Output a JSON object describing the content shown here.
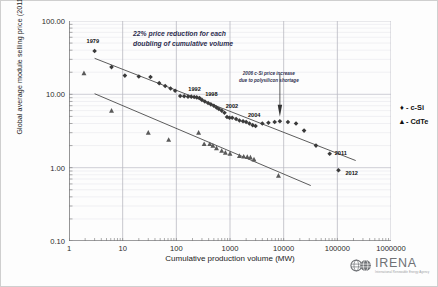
{
  "chart_data": {
    "type": "scatter",
    "title": "",
    "xlabel": "Cumulative production volume (MW)",
    "ylabel": "Global average module selling price (2011 USD/W)",
    "xscale": "log",
    "yscale": "log",
    "xlim": [
      1,
      1000000
    ],
    "ylim": [
      0.1,
      100
    ],
    "grid": true,
    "legend_position": "right",
    "xticks": [
      "1",
      "10",
      "100",
      "1000",
      "10000",
      "100000",
      "1000000"
    ],
    "yticks": [
      "100.00",
      "10.00",
      "1.00",
      "0.10"
    ],
    "annotations": [
      {
        "name": "learning-rate",
        "line1": "22% price reduction for each",
        "line2": "doubling of cumulative volume"
      },
      {
        "name": "polysilicon-shortage",
        "line1": "2006 c-Si price increase",
        "line2": "due to polysilicon shortage"
      }
    ],
    "point_labels": [
      {
        "text": "1979",
        "x": 3.0,
        "y": 39.0
      },
      {
        "text": "1992",
        "x": 135,
        "y": 10.6
      },
      {
        "text": "1998",
        "x": 290,
        "y": 8.9
      },
      {
        "text": "2002",
        "x": 700,
        "y": 6.2
      },
      {
        "text": "2004",
        "x": 1900,
        "y": 4.6
      },
      {
        "text": "2011",
        "x": 72000,
        "y": 1.55
      },
      {
        "text": "2012",
        "x": 105000,
        "y": 0.92
      }
    ],
    "series": [
      {
        "name": "c-Si",
        "marker": "diamond",
        "color": "#3a3a3a",
        "legend_label": "- c-Si",
        "points": [
          [
            3.0,
            39.0
          ],
          [
            6.2,
            23.5
          ],
          [
            11.0,
            18.0
          ],
          [
            20.0,
            17.5
          ],
          [
            33.0,
            17.2
          ],
          [
            48.0,
            14.2
          ],
          [
            62.0,
            13.0
          ],
          [
            78.0,
            12.0
          ],
          [
            95.0,
            11.2
          ],
          [
            118,
            9.5
          ],
          [
            140,
            9.4
          ],
          [
            165,
            9.3
          ],
          [
            190,
            9.3
          ],
          [
            215,
            9.2
          ],
          [
            240,
            9.1
          ],
          [
            270,
            8.9
          ],
          [
            300,
            8.4
          ],
          [
            340,
            8.0
          ],
          [
            390,
            7.6
          ],
          [
            440,
            7.3
          ],
          [
            500,
            7.0
          ],
          [
            560,
            6.6
          ],
          [
            620,
            6.3
          ],
          [
            700,
            6.0
          ],
          [
            790,
            5.6
          ],
          [
            880,
            4.9
          ],
          [
            980,
            4.8
          ],
          [
            1100,
            4.8
          ],
          [
            1300,
            4.6
          ],
          [
            1500,
            4.4
          ],
          [
            1750,
            4.3
          ],
          [
            2000,
            4.2
          ],
          [
            2300,
            4.0
          ],
          [
            2650,
            3.8
          ],
          [
            3000,
            3.7
          ],
          [
            4000,
            4.0
          ],
          [
            5200,
            4.1
          ],
          [
            6800,
            4.2
          ],
          [
            8500,
            4.3
          ],
          [
            12000,
            4.2
          ],
          [
            17000,
            4.0
          ],
          [
            24000,
            3.2
          ],
          [
            40000,
            2.0
          ],
          [
            72000,
            1.55
          ],
          [
            105000,
            0.92
          ]
        ]
      },
      {
        "name": "CdTe",
        "marker": "triangle",
        "color": "#5a5a5a",
        "legend_label": "- CdTe",
        "points": [
          [
            1.9,
            19.5
          ],
          [
            6.2,
            6.0
          ],
          [
            30,
            3.0
          ],
          [
            72,
            2.4
          ],
          [
            260,
            3.0
          ],
          [
            330,
            2.1
          ],
          [
            420,
            2.1
          ],
          [
            480,
            2.0
          ],
          [
            560,
            1.85
          ],
          [
            700,
            1.7
          ],
          [
            820,
            1.6
          ],
          [
            1000,
            1.55
          ],
          [
            1500,
            1.45
          ],
          [
            1800,
            1.42
          ],
          [
            2100,
            1.4
          ],
          [
            2400,
            1.38
          ],
          [
            2800,
            1.3
          ],
          [
            8000,
            0.78
          ]
        ]
      }
    ],
    "trendlines": [
      {
        "name": "c-Si-learning-curve",
        "x1": 3.0,
        "y1": 31.0,
        "x2": 220000,
        "y2": 1.25
      },
      {
        "name": "CdTe-learning-curve",
        "x1": 3.0,
        "y1": 10.2,
        "x2": 32000,
        "y2": 0.57
      }
    ]
  },
  "legend": {
    "items": [
      {
        "marker": "♦",
        "label": "- c-Si"
      },
      {
        "marker": "▲",
        "label": "- CdTe"
      }
    ]
  },
  "logo": {
    "name": "IRENA",
    "tagline": "International Renewable Energy Agency"
  }
}
